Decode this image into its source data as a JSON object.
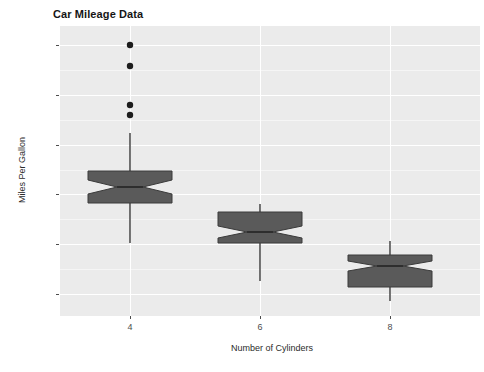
{
  "chart_data": {
    "type": "boxplot",
    "title": "Car Mileage Data",
    "xlabel": "Number of Cylinders",
    "ylabel": "Miles Per Gallon",
    "x_categories": [
      "4",
      "6",
      "8"
    ],
    "y_ticks": [
      "10",
      "15",
      "20",
      "25",
      "30",
      "35"
    ],
    "y_tick_values": [
      10,
      15,
      20,
      25,
      30,
      35
    ],
    "ylim": [
      7.0,
      36.5
    ],
    "grid": "horizontal-and-vertical-white-on-gray",
    "legend": "none",
    "notched": true,
    "boxes": [
      {
        "category": "4",
        "whisker_low": 21.4,
        "q1": 22.8,
        "median": 26.0,
        "q3": 30.4,
        "whisker_high": 33.9,
        "notch_low": 23.5,
        "notch_high": 28.6,
        "outliers": [
          33.9,
          32.4,
          30.4,
          27.3
        ]
      },
      {
        "category": "6",
        "whisker_low": 17.8,
        "q1": 18.65,
        "median": 19.7,
        "q3": 21.0,
        "whisker_high": 21.4,
        "notch_low": 19.0,
        "notch_high": 20.4,
        "outliers": []
      },
      {
        "category": "8",
        "whisker_low": 10.4,
        "q1": 14.4,
        "median": 15.2,
        "q3": 16.25,
        "whisker_high": 19.2,
        "notch_low": 14.8,
        "notch_high": 15.6,
        "outliers": []
      }
    ],
    "rendered_geometry": {
      "note": "pixel-space values read off the screenshot",
      "panel": {
        "left": 60,
        "top": 26,
        "width": 420,
        "height": 290
      },
      "y_pixel_per_unit": 9.96,
      "y_baseline_value": 10,
      "y_baseline_pixel": 294,
      "series": [
        {
          "category": "4",
          "center_x": 130,
          "half_width": 42,
          "notch_half_width": 13,
          "box_top_px": 171,
          "box_bottom_px": 203,
          "median_px": 187,
          "notch_top_px": 180,
          "notch_bottom_px": 194,
          "whisker_top_px": 133,
          "whisker_bottom_px": 243,
          "outliers_px": [
            45,
            66,
            105,
            115
          ]
        },
        {
          "category": "6",
          "center_x": 260,
          "half_width": 42,
          "notch_half_width": 13,
          "box_top_px": 212,
          "box_bottom_px": 243,
          "median_px": 232,
          "notch_top_px": 226,
          "notch_bottom_px": 238,
          "whisker_top_px": 204,
          "whisker_bottom_px": 281,
          "outliers_px": []
        },
        {
          "category": "8",
          "center_x": 390,
          "half_width": 42,
          "notch_half_width": 13,
          "box_top_px": 255,
          "box_bottom_px": 287,
          "median_px": 266,
          "notch_top_px": 261,
          "notch_bottom_px": 271,
          "whisker_top_px": 241,
          "whisker_bottom_px": 301,
          "outliers_px": []
        }
      ]
    },
    "colors": {
      "panel_background": "#ebebeb",
      "gridline_major": "#ffffff",
      "gridline_minor": "#f5f5f5",
      "box_fill": "#5a5a5a",
      "box_stroke": "#3a3a3a",
      "outlier": "#1c1c1c",
      "text": "#2b2b2b",
      "title": "#151515"
    }
  }
}
